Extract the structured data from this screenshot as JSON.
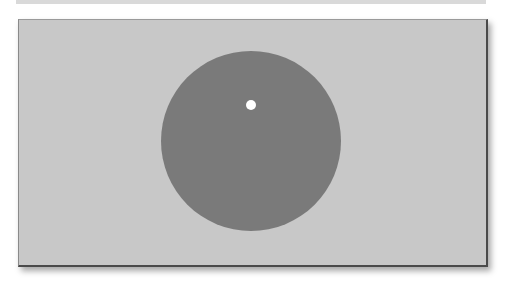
{
  "scene": {
    "background_color": "#ffffff",
    "panel": {
      "color": "#c8c8c8"
    },
    "disc": {
      "color": "#7a7a7a",
      "cx": 251,
      "cy": 141,
      "r": 90
    },
    "dot": {
      "color": "#ffffff",
      "cx": 251,
      "cy": 105,
      "r": 5
    }
  }
}
